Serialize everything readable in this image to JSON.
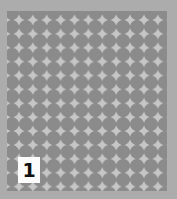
{
  "figure": {
    "pattern": "square-grid-of-circles",
    "colors": {
      "background": "#acacac",
      "gap": "#c6c6c6",
      "circle": "#8b8b8b",
      "label_bg": "#fbfbfb"
    },
    "label": "1"
  }
}
